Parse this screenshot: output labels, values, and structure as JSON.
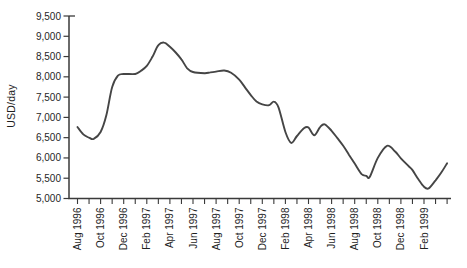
{
  "figure": {
    "background": "#ffffff"
  },
  "chart_data": {
    "type": "line",
    "title": "",
    "xlabel": "",
    "ylabel": "USD/day",
    "ylim": [
      5000,
      9500
    ],
    "ytick_step": 500,
    "ytick_labels": [
      "9,500",
      "9,000",
      "8,500",
      "8,000",
      "7,500",
      "7,000",
      "6,500",
      "6,000",
      "5,500",
      "5,000"
    ],
    "grid": false,
    "legend": false,
    "x_axis": {
      "unit": "months since Aug 1996",
      "months_total": 32,
      "minor_tick_every_months": 1,
      "label_every_months": 2,
      "tick_labels": [
        "Aug 1996",
        "Oct 1996",
        "Dec 1996",
        "Feb 1997",
        "Apr 1997",
        "Jun 1997",
        "Aug 1997",
        "Oct 1997",
        "Dec 1997",
        "Feb 1998",
        "Apr 1998",
        "Jun 1998",
        "Aug 1998",
        "Oct 1998",
        "Dec 1998",
        "Feb 1999"
      ]
    },
    "series": [
      {
        "name": "Daily rate (USD/day)",
        "points": [
          [
            0,
            6760
          ],
          [
            0.5,
            6580
          ],
          [
            1,
            6500
          ],
          [
            1.4,
            6470
          ],
          [
            2,
            6640
          ],
          [
            2.5,
            7060
          ],
          [
            3,
            7750
          ],
          [
            3.5,
            8030
          ],
          [
            4,
            8070
          ],
          [
            5,
            8070
          ],
          [
            5.5,
            8150
          ],
          [
            6,
            8270
          ],
          [
            6.5,
            8500
          ],
          [
            7,
            8780
          ],
          [
            7.5,
            8845
          ],
          [
            8,
            8740
          ],
          [
            8.5,
            8600
          ],
          [
            9,
            8430
          ],
          [
            9.5,
            8210
          ],
          [
            10,
            8120
          ],
          [
            11,
            8090
          ],
          [
            11.5,
            8110
          ],
          [
            12,
            8130
          ],
          [
            12.7,
            8155
          ],
          [
            13.3,
            8100
          ],
          [
            14,
            7930
          ],
          [
            14.5,
            7740
          ],
          [
            15,
            7550
          ],
          [
            15.5,
            7390
          ],
          [
            16,
            7320
          ],
          [
            16.6,
            7300
          ],
          [
            17,
            7390
          ],
          [
            17.4,
            7250
          ],
          [
            18,
            6640
          ],
          [
            18.5,
            6370
          ],
          [
            19,
            6540
          ],
          [
            19.6,
            6730
          ],
          [
            20,
            6750
          ],
          [
            20.5,
            6560
          ],
          [
            21,
            6760
          ],
          [
            21.4,
            6830
          ],
          [
            22,
            6670
          ],
          [
            22.5,
            6490
          ],
          [
            23,
            6300
          ],
          [
            23.5,
            6080
          ],
          [
            24,
            5860
          ],
          [
            24.6,
            5600
          ],
          [
            25,
            5560
          ],
          [
            25.3,
            5530
          ],
          [
            26,
            6000
          ],
          [
            26.8,
            6300
          ],
          [
            27.5,
            6160
          ],
          [
            28,
            5990
          ],
          [
            28.7,
            5790
          ],
          [
            29,
            5700
          ],
          [
            29.5,
            5480
          ],
          [
            30,
            5290
          ],
          [
            30.4,
            5250
          ],
          [
            31,
            5450
          ],
          [
            31.5,
            5640
          ],
          [
            32,
            5870
          ]
        ]
      }
    ],
    "colors": {
      "line": "#454545",
      "axis": "#3a3a3a",
      "text": "#1f1f1f"
    }
  }
}
